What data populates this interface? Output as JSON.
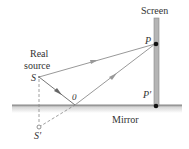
{
  "labels": {
    "screen": "Screen",
    "real_source_line1": "Real",
    "real_source_line2": "source",
    "source": "S",
    "image_source": "S′",
    "reflection_point": "0",
    "point_p": "P",
    "point_p_prime": "P′",
    "mirror": "Mirror"
  },
  "colors": {
    "ray": "#8a8a8a",
    "mirror": "#c8c8c8",
    "screen": "#b0b0b0",
    "dot": "#111111"
  }
}
